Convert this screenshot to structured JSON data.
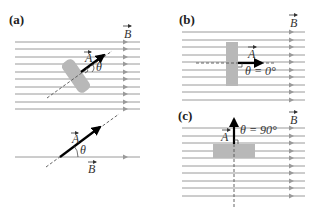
{
  "panels": {
    "a": {
      "label": "(a)",
      "field_label": "B",
      "area_vector_label": "A",
      "angle_label": "θ",
      "inset_area_vector_label": "A",
      "inset_angle_label": "θ",
      "inset_field_label": "B"
    },
    "b": {
      "label": "(b)",
      "field_label": "B",
      "area_vector_label": "A",
      "angle_label": "θ = 0°"
    },
    "c": {
      "label": "(c)",
      "field_label": "B",
      "area_vector_label": "A",
      "angle_label": "θ = 90°"
    }
  },
  "colors": {
    "field_lines": "#9a9a9a",
    "surface": "#b8b8b8",
    "vector": "#000000",
    "dashed_normal": "#555555"
  }
}
